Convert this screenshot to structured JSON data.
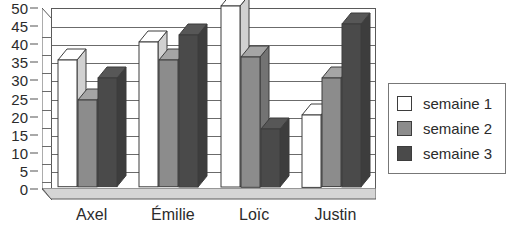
{
  "chart_data": {
    "type": "bar",
    "title": "",
    "subtitle": "",
    "xlabel": "",
    "ylabel": "",
    "categories": [
      "Axel",
      "Émilie",
      "Loïc",
      "Justin"
    ],
    "series": [
      {
        "name": "semaine 1",
        "values": [
          35,
          40,
          50,
          20
        ],
        "color": "#ffffff"
      },
      {
        "name": "semaine 2",
        "values": [
          24,
          35,
          36,
          30
        ],
        "color": "#8c8c8c"
      },
      {
        "name": "semaine 3",
        "values": [
          30,
          42,
          16,
          45
        ],
        "color": "#4a4a4a"
      }
    ],
    "ylim": [
      0,
      50
    ],
    "y_ticks": [
      0,
      5,
      10,
      15,
      20,
      25,
      30,
      35,
      40,
      45,
      50
    ],
    "y_tick_labels": [
      "0",
      "5",
      "10",
      "15",
      "20",
      "25",
      "30",
      "35",
      "40",
      "45",
      "50"
    ],
    "grid": true,
    "grid_axis": "y",
    "legend_position": "right",
    "style": "3d-bar"
  },
  "legend": {
    "items": [
      {
        "label": "semaine 1",
        "color": "#ffffff"
      },
      {
        "label": "semaine 2",
        "color": "#8c8c8c"
      },
      {
        "label": "semaine 3",
        "color": "#4a4a4a"
      }
    ]
  },
  "colors": {
    "series_1": "#ffffff",
    "series_2": "#8c8c8c",
    "series_3": "#4a4a4a",
    "floor": "#d5d5d5",
    "wall": "#ffffff",
    "outline": "#3d3d3d",
    "gridline": "#6b6b6b",
    "text": "#2b2b2b"
  }
}
